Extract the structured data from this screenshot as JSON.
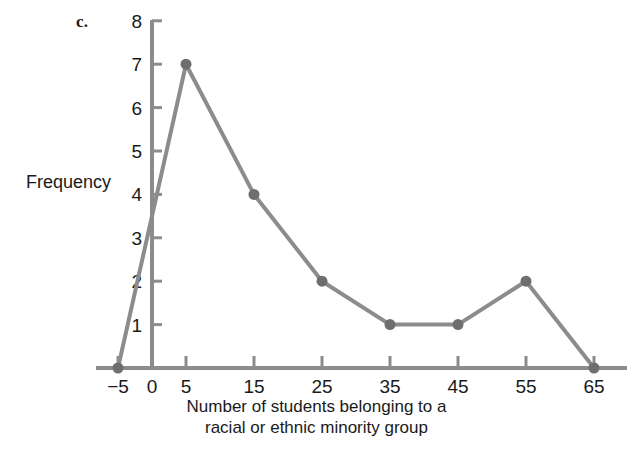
{
  "figure": {
    "part_label": "c.",
    "background_color": "#ffffff"
  },
  "chart_data": {
    "type": "line",
    "title": "",
    "subtitle": "",
    "xlabel_line1": "Number of students belonging to a",
    "xlabel_line2": "racial or ethnic minority group",
    "xlabel": "Number of students belonging to a racial or ethnic minority group",
    "ylabel": "Frequency",
    "x": [
      -5,
      5,
      15,
      25,
      35,
      45,
      55,
      65
    ],
    "values": [
      0,
      7,
      4,
      2,
      1,
      1,
      2,
      0
    ],
    "points": [
      {
        "x": -5,
        "y": 0
      },
      {
        "x": 5,
        "y": 7
      },
      {
        "x": 15,
        "y": 4
      },
      {
        "x": 25,
        "y": 2
      },
      {
        "x": 35,
        "y": 1
      },
      {
        "x": 45,
        "y": 1
      },
      {
        "x": 55,
        "y": 2
      },
      {
        "x": 65,
        "y": 0
      }
    ],
    "xticks": [
      -5,
      0,
      5,
      15,
      25,
      35,
      45,
      55,
      65
    ],
    "xtick_labels": [
      "−5",
      "0",
      "5",
      "15",
      "25",
      "35",
      "45",
      "55",
      "65"
    ],
    "yticks": [
      1,
      2,
      3,
      4,
      5,
      6,
      7,
      8
    ],
    "ytick_labels": [
      "1",
      "2",
      "3",
      "4",
      "5",
      "6",
      "7",
      "8"
    ],
    "xlim": [
      -8,
      72
    ],
    "ylim": [
      0,
      8
    ],
    "grid": false,
    "legend": false,
    "legend_position": "none",
    "series_color": "#8c8c8c",
    "marker_color": "#6e6e6e",
    "axis_color": "#8c8c8c",
    "marker": "circle",
    "line_width": 4
  }
}
